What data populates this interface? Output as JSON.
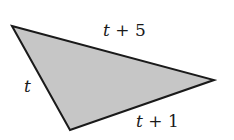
{
  "figure": {
    "shape": "triangle",
    "fill_color": "#c6c6c6",
    "stroke_color": "#1a1a1a",
    "vertices": [
      {
        "x": 12,
        "y": 26
      },
      {
        "x": 214,
        "y": 80
      },
      {
        "x": 70,
        "y": 130
      }
    ],
    "sides": [
      {
        "id": "top",
        "variable": "t",
        "operator": "+",
        "constant": "5",
        "label": "t + 5"
      },
      {
        "id": "left",
        "variable": "t",
        "operator": "",
        "constant": "",
        "label": "t"
      },
      {
        "id": "bottom",
        "variable": "t",
        "operator": "+",
        "constant": "1",
        "label": "t + 1"
      }
    ]
  }
}
